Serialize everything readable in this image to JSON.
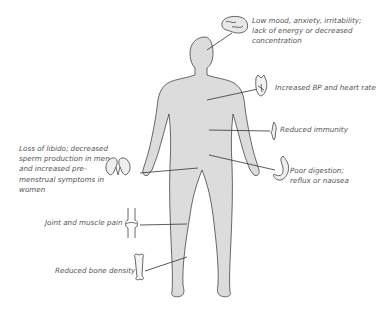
{
  "diagram": {
    "labels": [
      {
        "id": "brain",
        "icon": "brain-icon",
        "text": "Low mood, anxiety, irritability; lack of energy or decreased concentration"
      },
      {
        "id": "heart",
        "icon": "heart-icon",
        "text": "Increased BP and heart rate"
      },
      {
        "id": "immunity",
        "icon": "thymus-icon",
        "text": "Reduced immunity"
      },
      {
        "id": "digestion",
        "icon": "stomach-icon",
        "text": "Poor digestion; reflux or nausea"
      },
      {
        "id": "libido",
        "icon": "kidneys-icon",
        "text": "Loss of libido; decreased sperm production in men and increased pre-menstrual symptoms in women"
      },
      {
        "id": "joints",
        "icon": "knee-joint-icon",
        "text": "Joint and muscle pain"
      },
      {
        "id": "bone",
        "icon": "bone-icon",
        "text": "Reduced bone density"
      }
    ],
    "colors": {
      "body_fill": "#dcdcdc",
      "outline": "#444444",
      "text": "#555555",
      "leader": "#333333"
    }
  }
}
